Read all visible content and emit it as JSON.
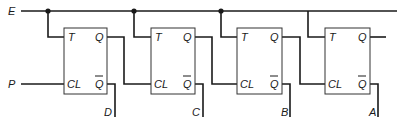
{
  "diagram": {
    "inputs": {
      "enable": "E",
      "pulse": "P"
    },
    "flip_flops": [
      {
        "id": "ff1",
        "t_label": "T",
        "cl_label": "CL",
        "q_label": "Q",
        "qbar_label": "Q",
        "output": "D"
      },
      {
        "id": "ff2",
        "t_label": "T",
        "cl_label": "CL",
        "q_label": "Q",
        "qbar_label": "Q",
        "output": "C"
      },
      {
        "id": "ff3",
        "t_label": "T",
        "cl_label": "CL",
        "q_label": "Q",
        "qbar_label": "Q",
        "output": "B"
      },
      {
        "id": "ff4",
        "t_label": "T",
        "cl_label": "CL",
        "q_label": "Q",
        "qbar_label": "Q",
        "output": "A"
      }
    ],
    "colors": {
      "line": "#1a1a1a",
      "box_border": "#333333",
      "background": "#ffffff"
    }
  }
}
